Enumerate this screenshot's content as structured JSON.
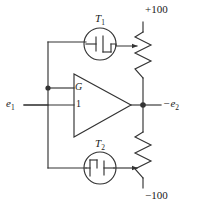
{
  "figure": {
    "type": "circuit-schematic",
    "width": 197,
    "height": 210,
    "line_color": "#333333",
    "text_color": "#1a1a1a",
    "background": "#ffffff"
  },
  "labels": {
    "transistor_top": "T",
    "transistor_top_sub": "1",
    "transistor_bottom": "T",
    "transistor_bottom_sub": "2",
    "supply_positive": "+100",
    "supply_negative": "−100",
    "input": "e",
    "input_sub": "1",
    "output": "−e",
    "output_sub": "2",
    "amp_gain_terminal": "G",
    "amp_unity_terminal": "1"
  },
  "components": [
    {
      "name": "amplifier",
      "kind": "triangle-amplifier",
      "terminals": [
        "G",
        "1"
      ],
      "output": "−e2"
    },
    {
      "name": "transistor-t1",
      "kind": "fet-in-circle",
      "label": "T1",
      "orientation": "gate-left",
      "connects_to": "top-potentiometer-wiper"
    },
    {
      "name": "transistor-t2",
      "kind": "fet-in-circle",
      "label": "T2",
      "orientation": "gate-right",
      "connects_to": "bottom-potentiometer-wiper"
    },
    {
      "name": "resistor-top",
      "kind": "zigzag-resistor",
      "rail": "+100",
      "zigzag_segments": 6
    },
    {
      "name": "resistor-bottom",
      "kind": "zigzag-resistor",
      "rail": "−100",
      "zigzag_segments": 6
    }
  ],
  "nodes": [
    {
      "name": "feedback-junction",
      "x": 48,
      "y": 88
    },
    {
      "name": "output-junction",
      "x": 143,
      "y": 105
    }
  ],
  "icon_names": [
    "fet-transistor-icon",
    "zigzag-resistor-icon",
    "triangle-amplifier-icon",
    "arrowhead-icon",
    "junction-dot-icon"
  ]
}
